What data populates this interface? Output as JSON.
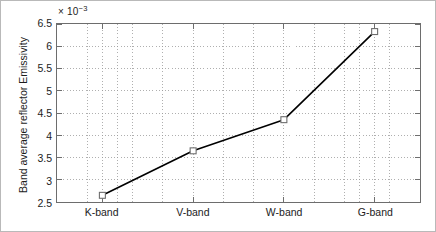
{
  "figure": {
    "background_color": "#ffffff",
    "border_color": "#b9b9b9",
    "axis_color": "#6d6d6d",
    "grid_color": "#9a9a9a",
    "line_color": "#000000",
    "marker_edge_color": "#6d6d6d",
    "marker_face_color": "#ffffff"
  },
  "axes": {
    "exponent_prefix": "× 10",
    "exponent_power": "−3",
    "ylabel": "Band average reflector Emissivity",
    "xlabel": "",
    "ytick_labels": [
      "2.5",
      "3",
      "3.5",
      "4",
      "4.5",
      "5",
      "5.5",
      "6",
      "6.5"
    ],
    "xtick_labels": [
      "K-band",
      "V-band",
      "W-band",
      "G-band"
    ]
  },
  "chart_data": {
    "type": "line",
    "title": "",
    "xlabel": "",
    "ylabel": "Band average reflector Emissivity",
    "y_multiplier": 0.001,
    "y_multiplier_label": "× 10−3",
    "categories": [
      "K-band",
      "V-band",
      "W-band",
      "G-band"
    ],
    "values": [
      2.65,
      3.65,
      4.35,
      6.33
    ],
    "values_absolute": [
      0.00265,
      0.00365,
      0.00435,
      0.00633
    ],
    "ylim": [
      2.5,
      6.5
    ],
    "ytick_values": [
      2.5,
      3,
      3.5,
      4,
      4.5,
      5,
      5.5,
      6,
      6.5
    ],
    "xlim": [
      0.5,
      4.5
    ],
    "grid": true,
    "grid_style": "dotted",
    "legend": null,
    "legend_position": "none",
    "marker": "square",
    "series": [
      {
        "name": "Band average reflector Emissivity",
        "values": [
          2.65,
          3.65,
          4.35,
          6.33
        ]
      }
    ]
  }
}
